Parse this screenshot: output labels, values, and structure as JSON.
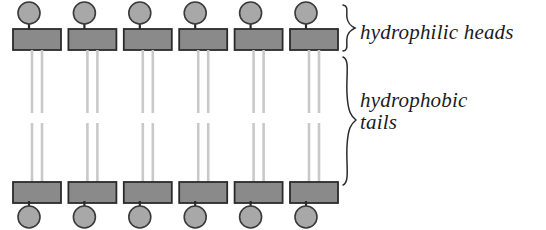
{
  "diagram": {
    "width": 546,
    "height": 230,
    "background": "#ffffff",
    "labels": {
      "heads": "hydrophilic heads",
      "tails_line1": "hydrophobic",
      "tails_line2": "tails"
    },
    "colors": {
      "head_circle_fill": "#a8a8a8",
      "head_circle_stroke": "#3a3a3a",
      "head_rect_fill": "#8a8a8a",
      "head_rect_stroke": "#2b2b2b",
      "tail_stroke": "#c9c9c9",
      "stem_stroke": "#2b2b2b",
      "brace_stroke": "#2b2b2b",
      "text": "#1c1c1c"
    },
    "structure": {
      "columns": 6,
      "column_start_x": 13,
      "column_pitch": 55.4,
      "rect_width": 48,
      "rect_height": 21,
      "circle_diameter": 22,
      "tails_per_lipid": 2,
      "tail_gap_px": 10,
      "tail_break_top": 113,
      "tail_break_bottom": 123,
      "top_circle_y": 2,
      "top_rect_y": 29,
      "bottom_rect_y": 182,
      "bottom_circle_y": 206
    },
    "braces": {
      "heads": {
        "top": 4,
        "bottom": 52,
        "x": 340
      },
      "tails": {
        "top": 56,
        "bottom": 186,
        "x": 340
      }
    }
  }
}
